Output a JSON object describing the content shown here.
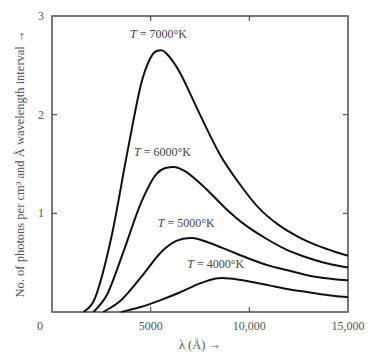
{
  "chart_data": {
    "type": "line",
    "title": "",
    "xlabel": "λ (Å) →",
    "ylabel": "No. of photons per cm³ and Å wavelength interval →",
    "xlim": [
      0,
      15000
    ],
    "ylim": [
      0,
      3
    ],
    "grid": false,
    "legend": "inline labels",
    "x_ticks": [
      0,
      5000,
      10000,
      15000
    ],
    "x_tick_labels": [
      "0",
      "5000",
      "10,000",
      "15,000"
    ],
    "y_ticks": [
      1,
      2,
      3
    ],
    "y_tick_labels": [
      "1",
      "2",
      "3"
    ],
    "series": [
      {
        "name": "T = 7000°K",
        "label_pos": [
          5400,
          2.78
        ],
        "points": [
          [
            1600,
            0
          ],
          [
            2200,
            0.15
          ],
          [
            3000,
            0.75
          ],
          [
            3800,
            1.6
          ],
          [
            4500,
            2.3
          ],
          [
            5000,
            2.58
          ],
          [
            5400,
            2.65
          ],
          [
            5800,
            2.62
          ],
          [
            6500,
            2.42
          ],
          [
            7500,
            2.0
          ],
          [
            8500,
            1.6
          ],
          [
            9500,
            1.3
          ],
          [
            10500,
            1.05
          ],
          [
            11500,
            0.88
          ],
          [
            12500,
            0.76
          ],
          [
            13500,
            0.67
          ],
          [
            14500,
            0.6
          ],
          [
            15000,
            0.57
          ]
        ]
      },
      {
        "name": "T = 6000°K",
        "label_pos": [
          5600,
          1.58
        ],
        "points": [
          [
            2100,
            0
          ],
          [
            2800,
            0.18
          ],
          [
            3600,
            0.6
          ],
          [
            4500,
            1.1
          ],
          [
            5300,
            1.4
          ],
          [
            6100,
            1.47
          ],
          [
            6800,
            1.42
          ],
          [
            7800,
            1.25
          ],
          [
            8800,
            1.05
          ],
          [
            9800,
            0.88
          ],
          [
            10800,
            0.75
          ],
          [
            11800,
            0.64
          ],
          [
            12800,
            0.56
          ],
          [
            13800,
            0.5
          ],
          [
            15000,
            0.45
          ]
        ]
      },
      {
        "name": "T = 5000°K",
        "label_pos": [
          6800,
          0.86
        ],
        "points": [
          [
            2600,
            0
          ],
          [
            3500,
            0.12
          ],
          [
            4500,
            0.35
          ],
          [
            5500,
            0.6
          ],
          [
            6300,
            0.72
          ],
          [
            7100,
            0.75
          ],
          [
            8000,
            0.7
          ],
          [
            9000,
            0.62
          ],
          [
            10000,
            0.54
          ],
          [
            11000,
            0.47
          ],
          [
            12000,
            0.42
          ],
          [
            13000,
            0.37
          ],
          [
            14000,
            0.34
          ],
          [
            15000,
            0.32
          ]
        ]
      },
      {
        "name": "T = 4000°K",
        "label_pos": [
          8300,
          0.45
        ],
        "points": [
          [
            3500,
            0
          ],
          [
            4500,
            0.05
          ],
          [
            5500,
            0.12
          ],
          [
            6500,
            0.2
          ],
          [
            7500,
            0.29
          ],
          [
            8300,
            0.34
          ],
          [
            9000,
            0.34
          ],
          [
            10000,
            0.31
          ],
          [
            11000,
            0.27
          ],
          [
            12000,
            0.23
          ],
          [
            13000,
            0.2
          ],
          [
            14000,
            0.17
          ],
          [
            15000,
            0.15
          ]
        ]
      }
    ]
  },
  "axes": {
    "xlabel": "λ (Å) →",
    "ylabel": "No. of photons per cm³ and Å wavelength interval →",
    "origin_label": "0"
  }
}
